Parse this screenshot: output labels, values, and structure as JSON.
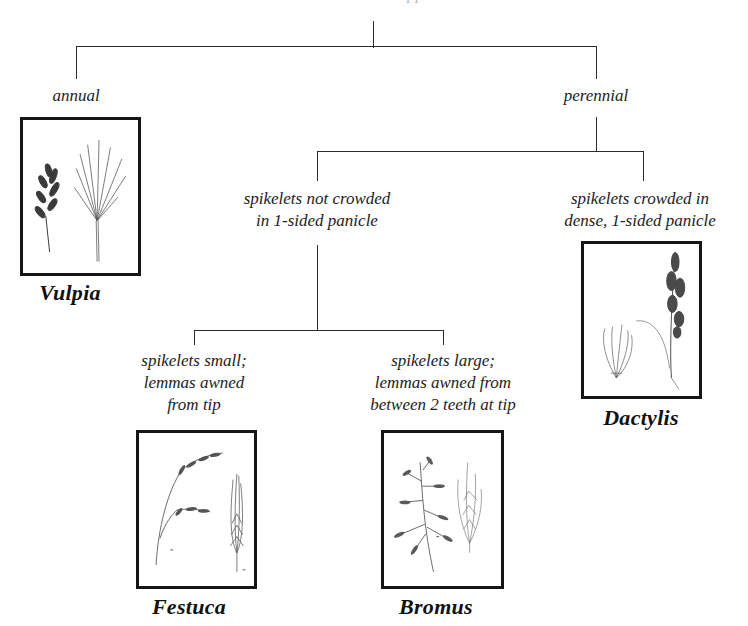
{
  "diagram": {
    "type": "dichotomous-key-tree",
    "root_clipped_text": "…pp",
    "branches": {
      "annual": "annual",
      "perennial": "perennial",
      "not_crowded": [
        "spikelets not crowded",
        "in 1-sided panicle"
      ],
      "crowded": [
        "spikelets crowded in",
        "dense, 1-sided panicle"
      ],
      "small": [
        "spikelets small;",
        "lemmas awned",
        "from tip"
      ],
      "large": [
        "spikelets large;",
        "lemmas awned from",
        "between 2 teeth at tip"
      ]
    },
    "genera": {
      "vulpia": {
        "name": "Vulpia",
        "illustration": "vulpia-grass-illustration"
      },
      "dactylis": {
        "name": "Dactylis",
        "illustration": "dactylis-grass-illustration"
      },
      "festuca": {
        "name": "Festuca",
        "illustration": "festuca-grass-illustration"
      },
      "bromus": {
        "name": "Bromus",
        "illustration": "bromus-grass-illustration"
      }
    },
    "colors": {
      "line": "#2b2b2b",
      "box_border": "#151515",
      "text": "#222222",
      "background": "#ffffff"
    }
  }
}
